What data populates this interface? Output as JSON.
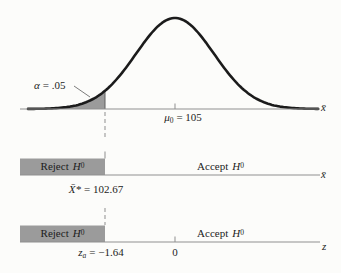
{
  "colors": {
    "shade_gray": "#9b9b9b",
    "curve_black": "#1b1b1b",
    "axis_gray": "#8f8f8f",
    "text": "#1c1c1c",
    "background": "#fcfcfa"
  },
  "top_chart": {
    "alpha_symbol": "α",
    "alpha_value": "= .05",
    "mean_symbol": "μ",
    "mean_sub": "0",
    "mean_value": "= 105",
    "axis_label": "x̄"
  },
  "xbar_bar": {
    "reject_word": "Reject",
    "h_symbol": "H",
    "h_sub": "0",
    "accept_word": "Accept",
    "critical_symbol": "X̄*",
    "critical_value": "= 102.67",
    "axis_label": "x̄"
  },
  "z_bar": {
    "reject_word": "Reject",
    "h_symbol": "H",
    "h_sub": "0",
    "accept_word": "Accept",
    "critical_symbol": "z",
    "critical_sub": "a",
    "critical_value": "= −1.64",
    "zero_label": "0",
    "axis_label": "z"
  },
  "chart_data": {
    "type": "area",
    "title": "",
    "alpha": 0.05,
    "mu0": 105,
    "critical_xbar": 102.67,
    "critical_z": -1.64,
    "curve": {
      "shape": "normal",
      "center_label": "μ₀ = 105",
      "shaded_region": "left tail below critical value",
      "shade_area_fraction": 0.05
    },
    "axes": [
      {
        "name": "sampling-distribution-axis",
        "label": "x̄",
        "ticks": [
          {
            "value": 105,
            "label": "μ₀ = 105"
          }
        ]
      },
      {
        "name": "xbar-decision-axis",
        "label": "x̄",
        "ticks": [
          {
            "value": 102.67,
            "label": "X̄* = 102.67"
          }
        ],
        "regions": [
          {
            "label": "Reject H₀",
            "range": "x̄ < 102.67",
            "shaded": true
          },
          {
            "label": "Accept H₀",
            "range": "x̄ ≥ 102.67",
            "shaded": false
          }
        ]
      },
      {
        "name": "z-decision-axis",
        "label": "z",
        "ticks": [
          {
            "value": -1.64,
            "label": "zₐ = −1.64"
          },
          {
            "value": 0,
            "label": "0"
          }
        ],
        "regions": [
          {
            "label": "Reject H₀",
            "range": "z < −1.64",
            "shaded": true
          },
          {
            "label": "Accept H₀",
            "range": "z ≥ −1.64",
            "shaded": false
          }
        ]
      }
    ],
    "legend": null,
    "grid": false
  }
}
